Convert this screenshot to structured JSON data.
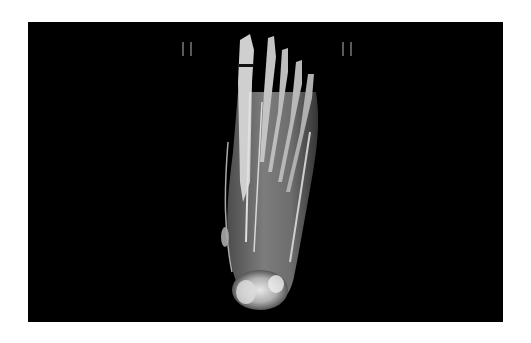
{
  "image": {
    "subject": "3D volume-rendered CT of foot (plantar view, toes up)",
    "background_color": "#000000",
    "page_color": "#ffffff"
  },
  "markers": [
    {
      "label": "II",
      "position": "left"
    },
    {
      "label": "II",
      "position": "right"
    }
  ]
}
